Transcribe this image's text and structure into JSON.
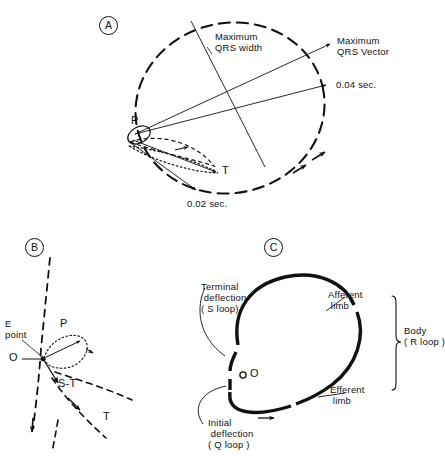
{
  "figure": {
    "background": "#ffffff",
    "ink": "#111111"
  },
  "panels": [
    {
      "id": "A",
      "letter": "A",
      "labels": {
        "max_qrs_width": "Maximum\nQRS width",
        "max_qrs_vector": "Maximum\nQRS Vector",
        "t004": "0.04 sec.",
        "t002": "0.02 sec.",
        "p_loop": "P",
        "t_loop": "T"
      }
    },
    {
      "id": "B",
      "letter": "B",
      "labels": {
        "e_point": "E\npoint",
        "p_loop": "P",
        "origin": "O",
        "st_segment": "S-T",
        "t_loop": "T"
      }
    },
    {
      "id": "C",
      "letter": "C",
      "labels": {
        "terminal_deflection": "Terminal\n deflection\n( S loop)",
        "initial_deflection": "Initial\n deflection\n( Q loop )",
        "afferent_limb": "Afferent\n limb",
        "efferent_limb": "Efferent\n limb",
        "body": "Body\n( R loop )",
        "origin": "O"
      }
    }
  ]
}
